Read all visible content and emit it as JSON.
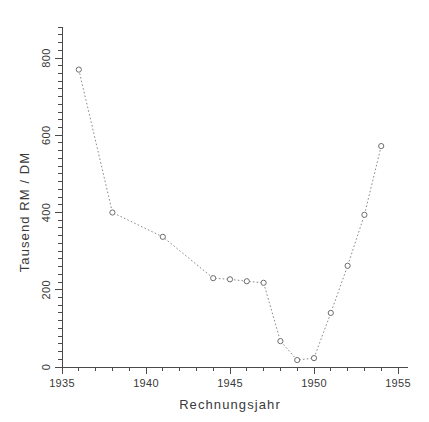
{
  "chart_data": {
    "type": "line",
    "title": "",
    "subtitle": "",
    "xlabel": "Rechnungsjahr",
    "ylabel": "Tausend RM / DM",
    "xlim": [
      1935,
      1955
    ],
    "ylim": [
      0,
      880
    ],
    "grid": false,
    "legend": null,
    "marker": "open-circle",
    "linestyle": "dotted",
    "line_color": "#8a8a8a",
    "marker_color": "#6d6d6d",
    "axis_color": "#4a4a4a",
    "text_color": "#3a3a3a",
    "x_ticks_major": [
      1935,
      1940,
      1945,
      1950,
      1955
    ],
    "x_tick_labels": [
      "1935",
      "1940",
      "1945",
      "1950",
      "1955"
    ],
    "x_tick_minor_step": 1,
    "y_ticks_major": [
      0,
      200,
      400,
      600,
      800
    ],
    "y_tick_labels": [
      "0",
      "200",
      "400",
      "600",
      "800"
    ],
    "y_tick_minor_step": 20,
    "x": [
      1936,
      1938,
      1941,
      1944,
      1945,
      1946,
      1947,
      1948,
      1949,
      1950,
      1951,
      1952,
      1953,
      1954
    ],
    "values": [
      770,
      400,
      337,
      230,
      227,
      222,
      218,
      67,
      18,
      23,
      140,
      262,
      394,
      572
    ],
    "series": [
      {
        "name": "Rechnungsjahr-Reihe",
        "x": [
          1936,
          1938,
          1941,
          1944,
          1945,
          1946,
          1947,
          1948,
          1949,
          1950,
          1951,
          1952,
          1953,
          1954
        ],
        "values": [
          770,
          400,
          337,
          230,
          227,
          222,
          218,
          67,
          18,
          23,
          140,
          262,
          394,
          572
        ]
      }
    ],
    "annotations": []
  }
}
